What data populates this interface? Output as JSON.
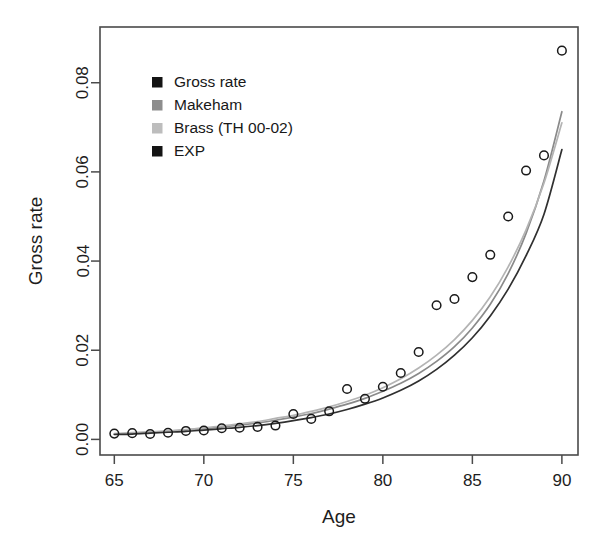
{
  "figure": {
    "background": "#ffffff",
    "frame_color": "#4a4a4a"
  },
  "chart_data": {
    "type": "scatter",
    "title": "",
    "xlabel": "Age",
    "ylabel": "Gross rate",
    "xlim": [
      64.2,
      90.9
    ],
    "ylim": [
      -0.0035,
      0.0925
    ],
    "xticks": [
      65,
      70,
      75,
      80,
      85,
      90
    ],
    "xtick_labels": [
      "65",
      "70",
      "75",
      "80",
      "85",
      "90"
    ],
    "yticks": [
      0.0,
      0.02,
      0.04,
      0.06,
      0.08
    ],
    "ytick_labels": [
      "0.00",
      "0.02",
      "0.04",
      "0.06",
      "0.08"
    ],
    "grid": false,
    "legend_position": "upper-left",
    "x": [
      65,
      66,
      67,
      68,
      69,
      70,
      71,
      72,
      73,
      74,
      75,
      76,
      77,
      78,
      79,
      80,
      81,
      82,
      83,
      84,
      85,
      86,
      87,
      88,
      89,
      90
    ],
    "series": [
      {
        "name": "Gross rate",
        "type": "points",
        "marker": "open-circle",
        "color": "#1a1a1a",
        "legend_swatch": "#141414",
        "values": [
          0.0013,
          0.0014,
          0.0012,
          0.0015,
          0.0019,
          0.002,
          0.0025,
          0.0026,
          0.0028,
          0.0031,
          0.0057,
          0.0046,
          0.0063,
          0.0113,
          0.0091,
          0.0118,
          0.0149,
          0.0196,
          0.0301,
          0.0315,
          0.0364,
          0.0414,
          0.05,
          0.0603,
          0.0637,
          0.0872
        ]
      },
      {
        "name": "Makeham",
        "type": "line",
        "color": "#8a8a8a",
        "legend_swatch": "#8d8d8d",
        "values": [
          0.0012,
          0.0014,
          0.0016,
          0.0018,
          0.0021,
          0.0024,
          0.0028,
          0.0032,
          0.0037,
          0.0043,
          0.005,
          0.0058,
          0.0068,
          0.0079,
          0.0092,
          0.0108,
          0.0126,
          0.0148,
          0.0175,
          0.0208,
          0.025,
          0.0303,
          0.0372,
          0.0462,
          0.058,
          0.0735
        ]
      },
      {
        "name": "Brass (TH 00-02)",
        "type": "line",
        "color": "#b4b4b4",
        "legend_swatch": "#bdbdbd",
        "values": [
          0.0013,
          0.0015,
          0.0017,
          0.0019,
          0.0022,
          0.0026,
          0.003,
          0.0035,
          0.004,
          0.0047,
          0.0054,
          0.0063,
          0.0073,
          0.0085,
          0.0099,
          0.0116,
          0.0136,
          0.016,
          0.0189,
          0.0224,
          0.0267,
          0.032,
          0.0387,
          0.047,
          0.0575,
          0.071
        ]
      },
      {
        "name": "EXP",
        "type": "line",
        "color": "#303030",
        "legend_swatch": "#141414",
        "values": [
          0.0011,
          0.0012,
          0.0014,
          0.0016,
          0.0018,
          0.0021,
          0.0024,
          0.0027,
          0.0031,
          0.0036,
          0.0042,
          0.0049,
          0.0057,
          0.0067,
          0.0079,
          0.0093,
          0.011,
          0.0131,
          0.0157,
          0.0189,
          0.0228,
          0.0277,
          0.0337,
          0.0412,
          0.0505,
          0.065
        ]
      }
    ]
  },
  "legend": {
    "items": [
      {
        "label": "Gross rate"
      },
      {
        "label": "Makeham"
      },
      {
        "label": "Brass (TH 00-02)"
      },
      {
        "label": "EXP"
      }
    ]
  }
}
